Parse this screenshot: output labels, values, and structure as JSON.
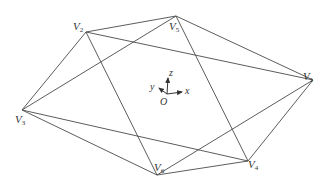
{
  "figure": {
    "type": "octahedron wireframe",
    "vertices": [
      {
        "id": "V1",
        "name": "V",
        "sub": "1"
      },
      {
        "id": "V2",
        "name": "V",
        "sub": "2"
      },
      {
        "id": "V3",
        "name": "V",
        "sub": "3"
      },
      {
        "id": "V4",
        "name": "V",
        "sub": "4"
      },
      {
        "id": "V5",
        "name": "V",
        "sub": "5"
      },
      {
        "id": "V6",
        "name": "V",
        "sub": "6"
      }
    ],
    "edges": [
      [
        "V2",
        "V5"
      ],
      [
        "V2",
        "V1"
      ],
      [
        "V2",
        "V3"
      ],
      [
        "V2",
        "V6"
      ],
      [
        "V5",
        "V1"
      ],
      [
        "V5",
        "V3"
      ],
      [
        "V5",
        "V4"
      ],
      [
        "V1",
        "V6"
      ],
      [
        "V1",
        "V4"
      ],
      [
        "V3",
        "V6"
      ],
      [
        "V3",
        "V4"
      ],
      [
        "V6",
        "V4"
      ]
    ],
    "axes": {
      "origin_label": "O",
      "x_label": "x",
      "y_label": "y",
      "z_label": "z"
    }
  }
}
